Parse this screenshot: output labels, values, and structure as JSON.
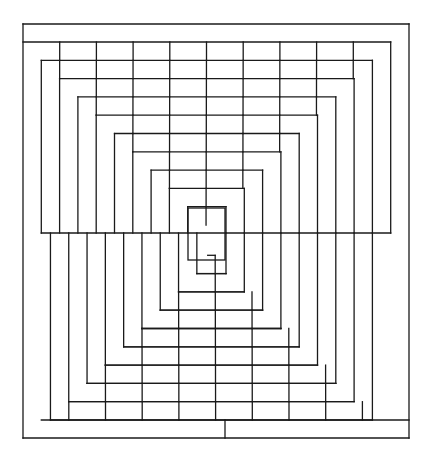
{
  "diagram": {
    "title": "",
    "stroke_color": "#1a1a1a",
    "background_color": "#ffffff",
    "frame": {
      "left": 23,
      "top": 24,
      "right": 409,
      "bottom": 438
    },
    "top_band_bottom": 42,
    "bottom_band_top": 420,
    "bottom_band_divider_x": 225,
    "seam_y": 233,
    "step": 18.3,
    "brick_width": 36.7,
    "upper_levels": 10,
    "lower_levels": 10,
    "center_rect": {
      "left": 188,
      "top": 208,
      "right": 225,
      "bottom": 260
    }
  }
}
